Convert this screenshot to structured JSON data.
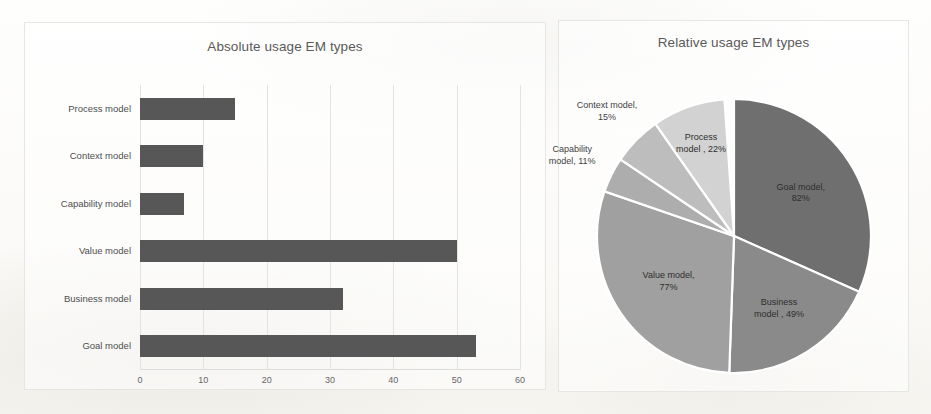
{
  "chart_data": [
    {
      "type": "bar",
      "title": "Absolute usage EM types",
      "orientation": "horizontal",
      "xlabel": "",
      "ylabel": "",
      "xlim": [
        0,
        60
      ],
      "xticks": [
        "0",
        "10",
        "20",
        "30",
        "40",
        "50",
        "60"
      ],
      "grid": true,
      "legend": "none",
      "bar_color": "#575757",
      "categories": [
        "Process model",
        "Context model",
        "Capability model",
        "Value model",
        "Business model",
        "Goal model"
      ],
      "values": [
        15,
        10,
        7,
        50,
        32,
        53
      ]
    },
    {
      "type": "pie",
      "title": "Relative usage EM types",
      "start_angle_deg": 0,
      "direction": "clockwise",
      "labels": [
        "Goal model",
        "Business model",
        "Value model",
        "Capability model",
        "Context model",
        "Process model"
      ],
      "percent_labels": [
        "82%",
        "49%",
        "77%",
        "11%",
        "15%",
        "22%"
      ],
      "values": [
        82,
        49,
        77,
        11,
        15,
        22
      ],
      "slice_angles_deg": [
        114,
        68,
        107,
        15,
        21,
        31
      ],
      "colors": [
        "#6f6f6f",
        "#8a8a8a",
        "#a0a0a0",
        "#adadad",
        "#bdbdbd",
        "#d2d2d2"
      ],
      "label_texts": [
        "Goal model,\n82%",
        "Business\nmodel , 49%",
        "Value model,\n77%",
        "Capability\nmodel, 11%",
        "Context model,\n15%",
        "Process\nmodel , 22%"
      ]
    }
  ]
}
